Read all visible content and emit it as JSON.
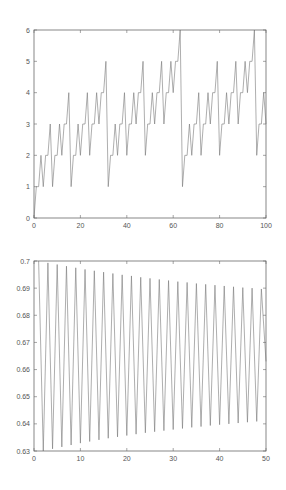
{
  "chart_data": [
    {
      "type": "line",
      "title": "",
      "xlabel": "",
      "ylabel": "",
      "xlim": [
        0,
        100
      ],
      "ylim": [
        0,
        6
      ],
      "xticks": [
        0,
        20,
        40,
        60,
        80,
        100
      ],
      "yticks": [
        0,
        1,
        2,
        3,
        4,
        5,
        6
      ],
      "grid": false,
      "legend": null,
      "series": [
        {
          "name": "binary digit sum",
          "x": [
            0,
            1,
            2,
            3,
            4,
            5,
            6,
            7,
            8,
            9,
            10,
            11,
            12,
            13,
            14,
            15,
            16,
            17,
            18,
            19,
            20,
            21,
            22,
            23,
            24,
            25,
            26,
            27,
            28,
            29,
            30,
            31,
            32,
            33,
            34,
            35,
            36,
            37,
            38,
            39,
            40,
            41,
            42,
            43,
            44,
            45,
            46,
            47,
            48,
            49,
            50,
            51,
            52,
            53,
            54,
            55,
            56,
            57,
            58,
            59,
            60,
            61,
            62,
            63,
            64,
            65,
            66,
            67,
            68,
            69,
            70,
            71,
            72,
            73,
            74,
            75,
            76,
            77,
            78,
            79,
            80,
            81,
            82,
            83,
            84,
            85,
            86,
            87,
            88,
            89,
            90,
            91,
            92,
            93,
            94,
            95,
            96,
            97,
            98,
            99,
            100
          ],
          "values": [
            0,
            1,
            1,
            2,
            1,
            2,
            2,
            3,
            1,
            2,
            2,
            3,
            2,
            3,
            3,
            4,
            1,
            2,
            2,
            3,
            2,
            3,
            3,
            4,
            2,
            3,
            3,
            4,
            3,
            4,
            4,
            5,
            1,
            2,
            2,
            3,
            2,
            3,
            3,
            4,
            2,
            3,
            3,
            4,
            3,
            4,
            4,
            5,
            2,
            3,
            3,
            4,
            3,
            4,
            4,
            5,
            3,
            4,
            4,
            5,
            4,
            5,
            5,
            6,
            1,
            2,
            2,
            3,
            2,
            3,
            3,
            4,
            2,
            3,
            3,
            4,
            3,
            4,
            4,
            5,
            2,
            3,
            3,
            4,
            3,
            4,
            4,
            5,
            3,
            4,
            4,
            5,
            4,
            5,
            5,
            6,
            2,
            3,
            3,
            4,
            3
          ]
        }
      ]
    },
    {
      "type": "line",
      "title": "",
      "xlabel": "",
      "ylabel": "",
      "xlim": [
        0,
        50
      ],
      "ylim": [
        0.63,
        0.7
      ],
      "xticks": [
        0,
        10,
        20,
        30,
        40,
        50
      ],
      "yticks": [
        0.63,
        0.64,
        0.65,
        0.66,
        0.67,
        0.68,
        0.69,
        0.7
      ],
      "grid": false,
      "legend": null,
      "series": [
        {
          "name": "oscillating sequence",
          "x": [
            1,
            2,
            3,
            4,
            5,
            6,
            7,
            8,
            9,
            10,
            11,
            12,
            13,
            14,
            15,
            16,
            17,
            18,
            19,
            20,
            21,
            22,
            23,
            24,
            25,
            26,
            27,
            28,
            29,
            30,
            31,
            32,
            33,
            34,
            35,
            36,
            37,
            38,
            39,
            40,
            41,
            42,
            43,
            44,
            45,
            46,
            47,
            48,
            49,
            50
          ],
          "values": [
            0.7,
            0.63,
            0.6993,
            0.6308,
            0.6987,
            0.6315,
            0.6981,
            0.6322,
            0.6975,
            0.6329,
            0.6969,
            0.6335,
            0.6964,
            0.6341,
            0.6959,
            0.6347,
            0.6954,
            0.6352,
            0.6949,
            0.6357,
            0.6945,
            0.6362,
            0.694,
            0.6367,
            0.6936,
            0.6371,
            0.6932,
            0.6375,
            0.6928,
            0.6379,
            0.6924,
            0.6383,
            0.6921,
            0.6387,
            0.6917,
            0.639,
            0.6914,
            0.6394,
            0.6911,
            0.6397,
            0.6908,
            0.64,
            0.6905,
            0.6403,
            0.6902,
            0.6406,
            0.69,
            0.6409,
            0.6897,
            0.663
          ]
        }
      ]
    }
  ]
}
